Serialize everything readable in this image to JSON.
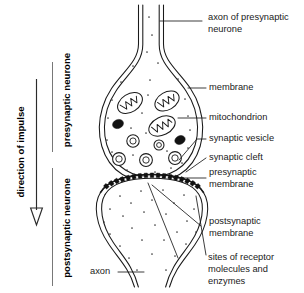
{
  "diagram": {
    "colors": {
      "ink": "#1a1a1a",
      "background": "#ffffff",
      "receptor": "#111111",
      "dense_vesicle": "#121212"
    },
    "side_annotations": {
      "impulse_direction": "direction of impulse",
      "upper_neurone": "presynaptic neurone",
      "lower_neurone": "postsynaptic neurone"
    },
    "labels": {
      "axon_presynaptic_line1": "axon of presynaptic",
      "axon_presynaptic_line2": "neurone",
      "membrane": "membrane",
      "mitochondrion": "mitochondrion",
      "synaptic_vesicle": "synaptic vesicle",
      "synaptic_cleft": "synaptic cleft",
      "presynaptic_membrane_line1": "presynaptic",
      "presynaptic_membrane_line2": "membrane",
      "postsynaptic_membrane_line1": "postsynaptic",
      "postsynaptic_membrane_line2": "membrane",
      "receptor_sites_line1": "sites of receptor",
      "receptor_sites_line2": "molecules and",
      "receptor_sites_line3": "enzymes",
      "axon": "axon"
    },
    "structures": {
      "mitochondria_count": 3,
      "synaptic_vesicles_count": 5,
      "dense_vesicles_count": 2,
      "receptor_sites_count": 17
    }
  }
}
